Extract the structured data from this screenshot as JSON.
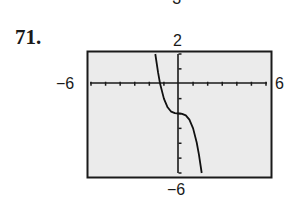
{
  "problem": {
    "number": "71.",
    "clipped_previous_label": "−3"
  },
  "window": {
    "xmin_label": "−6",
    "xmax_label": "6",
    "ymin_label": "−6",
    "ymax_label": "2"
  },
  "colors": {
    "screen_bg": "#ebebeb",
    "frame": "#1a1a1a",
    "axis": "#1a1a1a",
    "curve": "#111111"
  },
  "chart_data": {
    "type": "line",
    "title": "",
    "xlabel": "",
    "ylabel": "",
    "xlim": [
      -6,
      6
    ],
    "ylim": [
      -6,
      2
    ],
    "xscale": 1,
    "yscale": 1,
    "grid": false,
    "legend": null,
    "tick_labels": {
      "xmin": "−6",
      "xmax": "6",
      "ymin": "−6",
      "ymax": "2"
    },
    "series": [
      {
        "name": "f(x)",
        "description": "cubic curve, decreasing, horizontal inflection at (0, -2)",
        "x": [
          -1.59,
          -1.4,
          -1.26,
          -1.0,
          -0.75,
          -0.5,
          -0.25,
          0,
          0.25,
          0.5,
          0.75,
          1.0,
          1.25,
          1.4,
          1.59
        ],
        "y": [
          2.0,
          0.74,
          0.0,
          -1.0,
          -1.58,
          -1.88,
          -1.98,
          -2.0,
          -2.02,
          -2.13,
          -2.42,
          -3.0,
          -3.95,
          -4.74,
          -6.0
        ]
      }
    ],
    "annotations": [
      {
        "text": "x-intercept ≈ -1.26"
      },
      {
        "text": "y-intercept = -2"
      }
    ]
  }
}
